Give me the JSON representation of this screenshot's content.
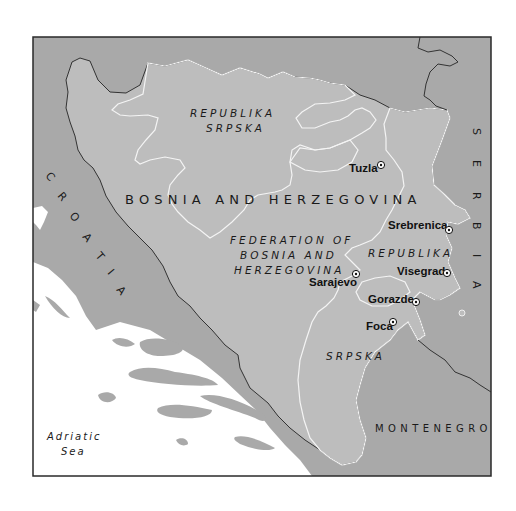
{
  "map": {
    "colors": {
      "background": "#ffffff",
      "neighbor_land": "#a9a9a9",
      "bosnia_land": "#bdbdbd",
      "hatch_stripe": "#f2f2f2",
      "sea": "#ffffff",
      "frame": "#2a2a2a",
      "text": "#1a1a1a"
    },
    "country_label": "BOSNIA AND HERZEGOVINA",
    "neighbors": {
      "croatia": "CROATIA",
      "serbia": "SERBIA",
      "montenegro": "MONTENEGRO"
    },
    "croatia_letters": [
      "C",
      "R",
      "O",
      "A",
      "T",
      "I",
      "A"
    ],
    "serbia_letters": [
      "S",
      "E",
      "R",
      "B",
      "I",
      "A"
    ],
    "entities": {
      "rs_north_line1": "REPUBLIKA",
      "rs_north_line2": "SRPSKA",
      "federation_line1": "FEDERATION OF",
      "federation_line2": "BOSNIA AND",
      "federation_line3": "HERZEGOVINA",
      "rs_east_line1": "REPUBLIKA",
      "rs_east_line2": "SRPSKA"
    },
    "cities": [
      {
        "name": "Tuzla",
        "icon": "city-marker-icon"
      },
      {
        "name": "Srebrenica",
        "icon": "city-marker-icon"
      },
      {
        "name": "Sarajevo",
        "icon": "city-marker-icon"
      },
      {
        "name": "Visegrad",
        "icon": "city-marker-icon"
      },
      {
        "name": "Gorazde",
        "icon": "city-marker-icon"
      },
      {
        "name": "Foca",
        "icon": "city-marker-icon"
      }
    ],
    "sea": {
      "line1": "Adriatic",
      "line2": "Sea"
    },
    "legend": {
      "hatched_area": "Republika Srpska",
      "plain_area": "Federation of Bosnia and Herzegovina"
    }
  }
}
